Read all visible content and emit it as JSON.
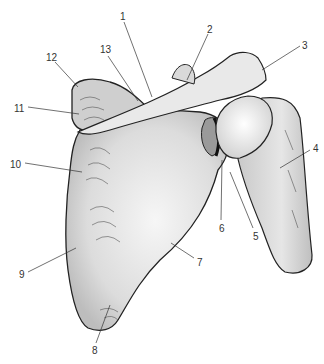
{
  "figure": {
    "background_color": "#ffffff",
    "bone_fill": "#e4e4e4",
    "outline_color": "#222222",
    "label_color": "#333333"
  },
  "labels": [
    {
      "id": "1",
      "text": "1",
      "x": 120,
      "y": 12
    },
    {
      "id": "2",
      "text": "2",
      "x": 207,
      "y": 25
    },
    {
      "id": "3",
      "text": "3",
      "x": 302,
      "y": 41
    },
    {
      "id": "4",
      "text": "4",
      "x": 313,
      "y": 144
    },
    {
      "id": "5",
      "text": "5",
      "x": 253,
      "y": 232
    },
    {
      "id": "6",
      "text": "6",
      "x": 219,
      "y": 224
    },
    {
      "id": "7",
      "text": "7",
      "x": 197,
      "y": 258
    },
    {
      "id": "8",
      "text": "8",
      "x": 92,
      "y": 346
    },
    {
      "id": "9",
      "text": "9",
      "x": 19,
      "y": 270
    },
    {
      "id": "10",
      "text": "10",
      "x": 10,
      "y": 160
    },
    {
      "id": "11",
      "text": "11",
      "x": 14,
      "y": 104
    },
    {
      "id": "12",
      "text": "12",
      "x": 46,
      "y": 53
    },
    {
      "id": "13",
      "text": "13",
      "x": 100,
      "y": 45
    }
  ]
}
